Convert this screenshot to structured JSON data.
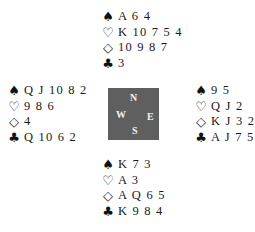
{
  "suit_symbols": {
    "spades": "♠",
    "hearts": "♡",
    "diamonds": "◇",
    "clubs": "♣"
  },
  "compass": {
    "north": "N",
    "west": "W",
    "east": "E",
    "south": "S",
    "color": "#5f5f5f"
  },
  "hands": {
    "north": {
      "spades": "A 6 4",
      "hearts": "K 10 7 5 4",
      "diamonds": "10 9 8 7",
      "clubs": "3"
    },
    "west": {
      "spades": "Q J 10 8 2",
      "hearts": "9 8 6",
      "diamonds": "4",
      "clubs": "Q 10 6 2"
    },
    "east": {
      "spades": "9 5",
      "hearts": "Q J 2",
      "diamonds": "K J 3 2",
      "clubs": "A J 7 5"
    },
    "south": {
      "spades": "K 7 3",
      "hearts": "A 3",
      "diamonds": "A Q 6 5",
      "clubs": "K 9 8 4"
    }
  }
}
